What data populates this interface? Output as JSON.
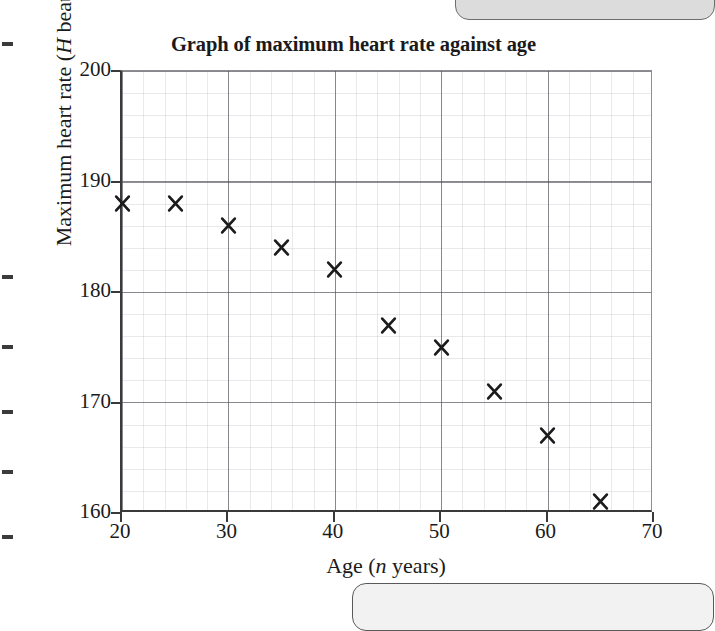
{
  "figure": {
    "title": "Graph of maximum heart rate against age",
    "y_axis_title_pre": "Maximum heart rate (",
    "y_axis_title_var": "H",
    "y_axis_title_post": " beats per minute)",
    "x_axis_title_pre": "Age (",
    "x_axis_title_var": "n",
    "x_axis_title_post": " years)"
  },
  "chart_data": {
    "type": "scatter",
    "title": "Graph of maximum heart rate against age",
    "xlabel": "Age (n years)",
    "ylabel": "Maximum heart rate (H beats per minute)",
    "xlim": [
      20,
      70
    ],
    "ylim": [
      160,
      200
    ],
    "xticks": [
      "20",
      "30",
      "40",
      "50",
      "60",
      "70"
    ],
    "yticks": [
      "160",
      "170",
      "180",
      "190",
      "200"
    ],
    "xtick_values": [
      20,
      30,
      40,
      50,
      60,
      70
    ],
    "ytick_values": [
      160,
      170,
      180,
      190,
      200
    ],
    "x_major_step": 10,
    "y_major_step": 10,
    "grid": true,
    "grid_minor": true,
    "legend": "none",
    "marker": "x",
    "marker_color": "#1b1b1b",
    "x": [
      20,
      25,
      30,
      35,
      40,
      45,
      50,
      55,
      60,
      65
    ],
    "y": [
      188,
      188,
      186,
      184,
      182,
      177,
      175,
      171,
      167,
      161
    ],
    "points": [
      {
        "x": 20,
        "y": 188
      },
      {
        "x": 25,
        "y": 188
      },
      {
        "x": 30,
        "y": 186
      },
      {
        "x": 35,
        "y": 184
      },
      {
        "x": 40,
        "y": 182
      },
      {
        "x": 45,
        "y": 177
      },
      {
        "x": 50,
        "y": 175
      },
      {
        "x": 55,
        "y": 171
      },
      {
        "x": 60,
        "y": 167
      },
      {
        "x": 65,
        "y": 161
      }
    ]
  },
  "scan_artifacts": {
    "margin_tick_positions": [
      42,
      275,
      345,
      410,
      470,
      535
    ]
  }
}
